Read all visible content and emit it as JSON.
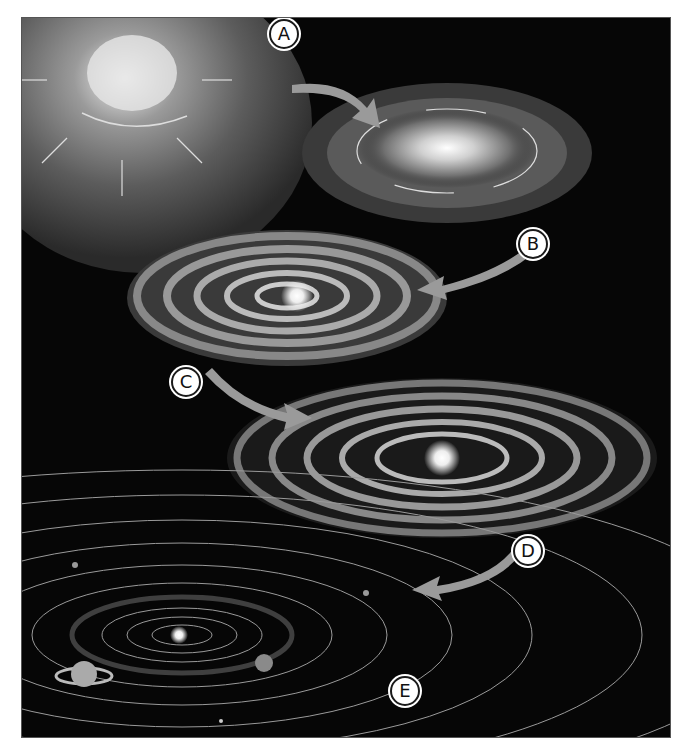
{
  "figure": {
    "background_color": "#060606",
    "arrow_color": "#9a9a9a",
    "stages": [
      {
        "id": "A",
        "label": "A",
        "name": "collapsing-nebula"
      },
      {
        "id": "B",
        "label": "B",
        "name": "rotating-flattening-cloud"
      },
      {
        "id": "C",
        "label": "C",
        "name": "protoplanetary-disk"
      },
      {
        "id": "D",
        "label": "D",
        "name": "ringed-disk-with-planetesimals"
      },
      {
        "id": "E",
        "label": "E",
        "name": "solar-system-with-orbits"
      }
    ]
  }
}
